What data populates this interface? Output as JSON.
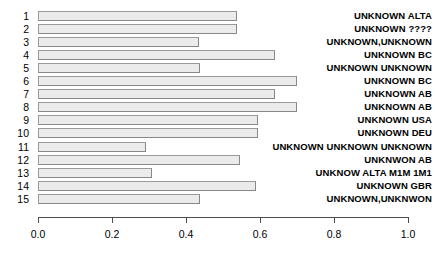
{
  "chart_data": {
    "type": "bar",
    "orientation": "horizontal",
    "title": "",
    "xlabel": "",
    "ylabel": "",
    "xlim": [
      0.0,
      1.0
    ],
    "xticks": [
      "0.0",
      "0.2",
      "0.4",
      "0.6",
      "0.8",
      "1.0"
    ],
    "xtick_values": [
      0.0,
      0.2,
      0.4,
      0.6,
      0.8,
      1.0
    ],
    "grid": false,
    "legend": "none",
    "bar_fill_color": "#ebebeb",
    "bar_border_color": "#888888",
    "categories": [
      "1",
      "2",
      "3",
      "4",
      "5",
      "6",
      "7",
      "8",
      "9",
      "10",
      "11",
      "12",
      "13",
      "14",
      "15"
    ],
    "values": [
      0.538,
      0.538,
      0.435,
      0.64,
      0.438,
      0.7,
      0.64,
      0.7,
      0.595,
      0.595,
      0.292,
      0.546,
      0.308,
      0.589,
      0.438
    ],
    "right_labels": [
      "UNKNOWN ALTA",
      "UNKNOWN ????",
      "UNKNOWN,UNKNOWN",
      "UNKNOWN BC",
      "UNKNOWN UNKNOWN",
      "UNKNOWN BC",
      "UNKNOWN AB",
      "UNKNOWN AB",
      "UNKNOWN USA",
      "UNKNOWN DEU",
      "UNKNOWN UNKNOWN UNKNOWN",
      "UNKNWON AB",
      "UNKNOW ALTA M1M 1M1",
      "UNKNOWN GBR",
      "UNKNOWN,UNKNWON"
    ]
  }
}
